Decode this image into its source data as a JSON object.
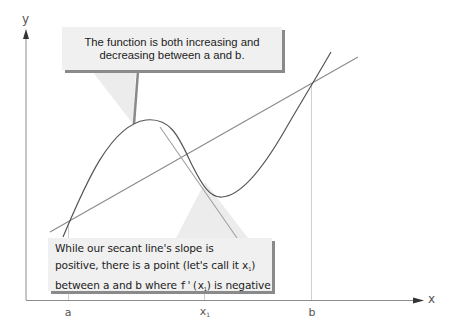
{
  "diagram": {
    "axes": {
      "x_label": "x",
      "y_label": "y"
    },
    "ticks": [
      {
        "label": "a",
        "sub": "",
        "x": 68
      },
      {
        "label": "x",
        "sub": "1",
        "x": 204
      },
      {
        "label": "b",
        "sub": "",
        "x": 312
      }
    ],
    "callouts": {
      "top": {
        "line1": "The function is both increasing and",
        "line2": "decreasing between a and b."
      },
      "bottom": {
        "line1": "While our secant line's slope is",
        "line2_pre": "positive, there is a point (let's call it ",
        "line2_var": "x",
        "line2_sub": "1",
        "line2_post": ")",
        "line3_pre": "between a and b where ",
        "line3_func": "f'(",
        "line3_var": "x",
        "line3_sub": "1",
        "line3_post": ")",
        "line3_end": " is negative"
      }
    },
    "colors": {
      "curve": "#555555",
      "secant": "#888888",
      "tangent": "#999999",
      "axis": "#888888",
      "callout_bg": "#f0f0f0",
      "callout_shadow": "#8a8a8a"
    }
  }
}
